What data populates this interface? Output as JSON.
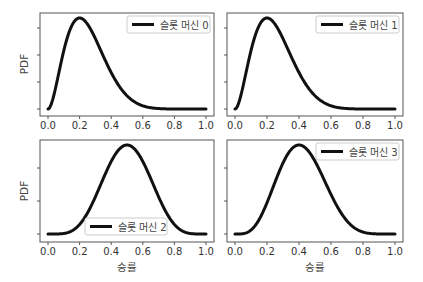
{
  "chart_data": [
    {
      "type": "line",
      "panel": "top-left",
      "distribution": "beta",
      "alpha": 3,
      "beta": 9,
      "series": [
        {
          "name": "슬롯 머신 0",
          "color": "#111111"
        }
      ],
      "xlabel": "",
      "ylabel": "PDF",
      "xlim": [
        0.0,
        1.0
      ],
      "xticks": [
        "0.0",
        "0.2",
        "0.4",
        "0.6",
        "0.8",
        "1.0"
      ],
      "yticks_count": 4,
      "ytick_labels": [],
      "peak_x": 0.2,
      "legend_position": "upper right"
    },
    {
      "type": "line",
      "panel": "top-right",
      "distribution": "beta",
      "alpha": 3,
      "beta": 9,
      "series": [
        {
          "name": "슬롯 머신 1",
          "color": "#111111"
        }
      ],
      "xlabel": "",
      "ylabel": "",
      "xlim": [
        0.0,
        1.0
      ],
      "xticks": [
        "0.0",
        "0.2",
        "0.4",
        "0.6",
        "0.8",
        "1.0"
      ],
      "yticks_count": 4,
      "ytick_labels": [],
      "peak_x": 0.2,
      "legend_position": "upper right"
    },
    {
      "type": "line",
      "panel": "bottom-left",
      "distribution": "beta",
      "alpha": 6,
      "beta": 6,
      "series": [
        {
          "name": "슬롯 머신 2",
          "color": "#111111"
        }
      ],
      "xlabel": "승률",
      "ylabel": "PDF",
      "xlim": [
        0.0,
        1.0
      ],
      "xticks": [
        "0.0",
        "0.2",
        "0.4",
        "0.6",
        "0.8",
        "1.0"
      ],
      "yticks_count": 3,
      "ytick_labels": [],
      "peak_x": 0.5,
      "legend_position": "lower center"
    },
    {
      "type": "line",
      "panel": "bottom-right",
      "distribution": "beta",
      "alpha": 5,
      "beta": 7,
      "series": [
        {
          "name": "슬롯 머신 3",
          "color": "#111111"
        }
      ],
      "xlabel": "승률",
      "ylabel": "",
      "xlim": [
        0.0,
        1.0
      ],
      "xticks": [
        "0.0",
        "0.2",
        "0.4",
        "0.6",
        "0.8",
        "1.0"
      ],
      "yticks_count": 3,
      "ytick_labels": [],
      "peak_x": 0.4,
      "legend_position": "upper right"
    }
  ],
  "labels": {
    "ylabel": "PDF",
    "xlabel": "승률",
    "legend": [
      "슬롯 머신 0",
      "슬롯 머신 1",
      "슬롯 머신 2",
      "슬롯 머신 3"
    ],
    "xticks": [
      "0.0",
      "0.2",
      "0.4",
      "0.6",
      "0.8",
      "1.0"
    ]
  }
}
